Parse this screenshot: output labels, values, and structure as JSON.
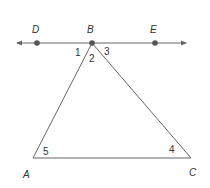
{
  "diagram": {
    "type": "geometry",
    "colors": {
      "line": "#666666",
      "point": "#555555",
      "text": "#333333",
      "background": "#ffffff"
    },
    "line": {
      "name": "DE",
      "points_on_line": [
        "D",
        "B",
        "E"
      ],
      "arrows": "both-ends"
    },
    "points": {
      "D": {
        "label": "D"
      },
      "B": {
        "label": "B"
      },
      "E": {
        "label": "E"
      },
      "A": {
        "label": "A"
      },
      "C": {
        "label": "C"
      }
    },
    "triangle": {
      "vertices": [
        "A",
        "B",
        "C"
      ]
    },
    "angles": {
      "a1": {
        "label": "1",
        "at": "B",
        "between": "BD and BA"
      },
      "a2": {
        "label": "2",
        "at": "B",
        "between": "BA and BC"
      },
      "a3": {
        "label": "3",
        "at": "B",
        "between": "BC and BE"
      },
      "a4": {
        "label": "4",
        "at": "C",
        "between": "CB and CA"
      },
      "a5": {
        "label": "5",
        "at": "A",
        "between": "AB and AC"
      }
    }
  }
}
